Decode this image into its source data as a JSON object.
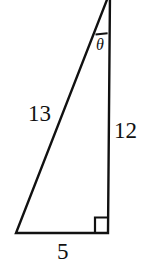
{
  "figure": {
    "background_color": "#ffffff",
    "stroke_color": "#111111",
    "labels": {
      "hypotenuse": "13",
      "vertical_leg": "12",
      "base_leg": "5",
      "angle": "θ"
    },
    "markers": {
      "right_angle": "right-angle-square",
      "angle_arc": "angle-arc"
    },
    "geometry": {
      "apex": [
        110,
        0
      ],
      "bottom_right": [
        108,
        233
      ],
      "bottom_left": [
        16,
        233
      ]
    }
  }
}
